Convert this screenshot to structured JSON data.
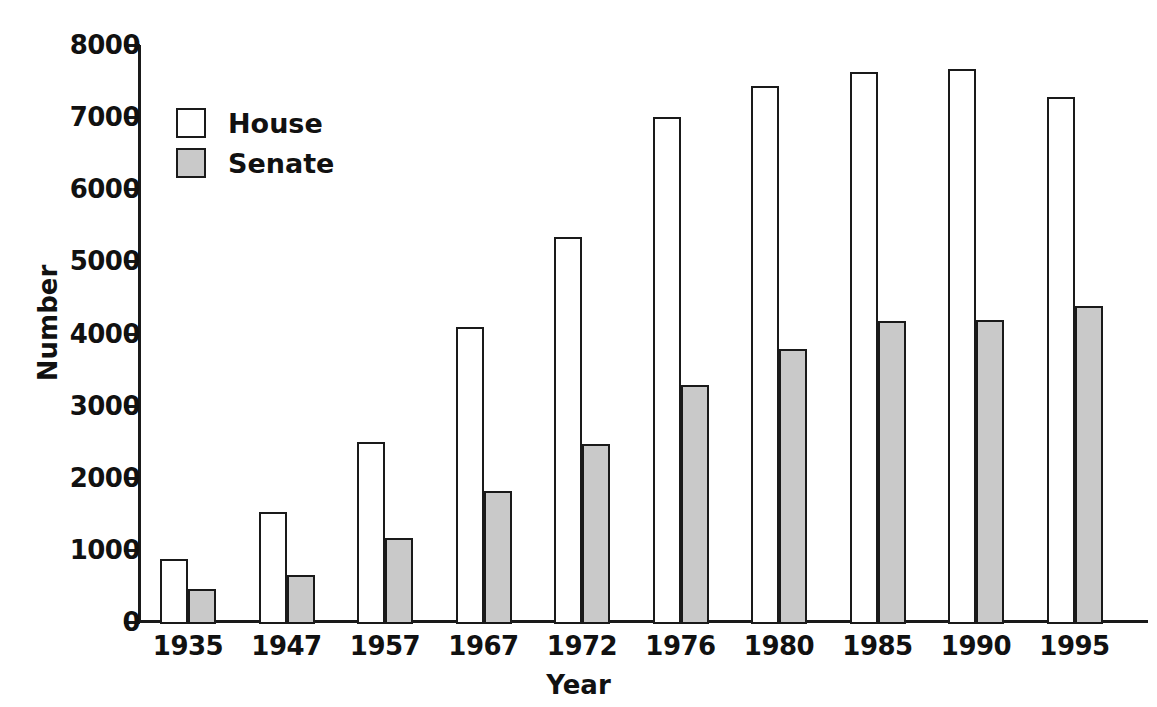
{
  "chart_data": {
    "type": "bar",
    "title": "",
    "xlabel": "Year",
    "ylabel": "Number",
    "categories": [
      "1935",
      "1947",
      "1957",
      "1967",
      "1972",
      "1976",
      "1980",
      "1985",
      "1990",
      "1995"
    ],
    "series": [
      {
        "name": "House",
        "color": "#ffffff",
        "values": [
          870,
          1520,
          2490,
          4090,
          5340,
          7000,
          7430,
          7630,
          7670,
          7280
        ]
      },
      {
        "name": "Senate",
        "color": "#c9c9c9",
        "values": [
          460,
          650,
          1170,
          1810,
          2470,
          3280,
          3790,
          4170,
          4190,
          4380
        ]
      }
    ],
    "ylim": [
      0,
      8000
    ],
    "y_ticks": [
      "0",
      "1000",
      "2000",
      "3000",
      "4000",
      "5000",
      "6000",
      "7000",
      "8000"
    ],
    "y_tick_values": [
      0,
      1000,
      2000,
      3000,
      4000,
      5000,
      6000,
      7000,
      8000
    ],
    "grid": false,
    "legend_position": "upper-left-inside",
    "legend_entries": [
      "House",
      "Senate"
    ],
    "axis_color": "#1a1a1a",
    "bar_outline_color": "#1a1a1a"
  }
}
